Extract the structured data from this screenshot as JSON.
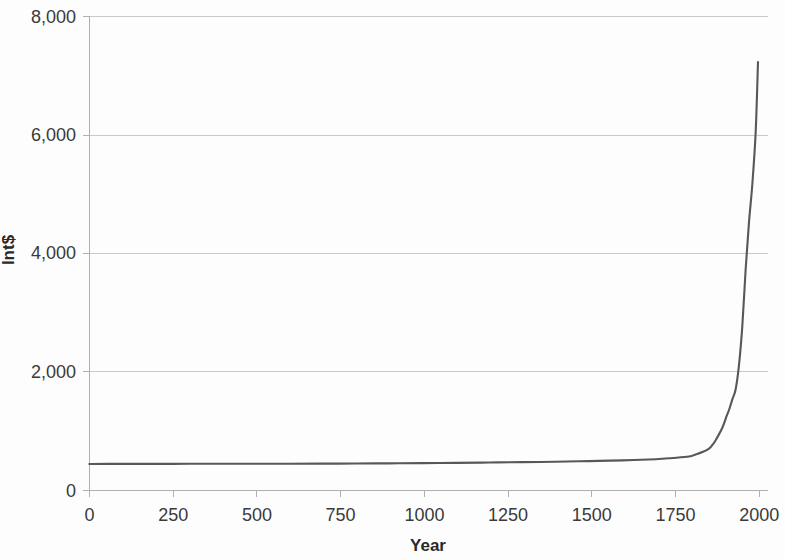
{
  "chart_data": {
    "type": "line",
    "title": "",
    "xlabel": "Year",
    "ylabel": "Int$",
    "xlim": [
      0,
      2010
    ],
    "ylim": [
      0,
      8000
    ],
    "grid": true,
    "legend": false,
    "x_ticks": [
      0,
      250,
      500,
      750,
      1000,
      1250,
      1500,
      1750,
      2000
    ],
    "x_tick_labels": [
      "0",
      "250",
      "500",
      "750",
      "1000",
      "1250",
      "1500",
      "1750",
      "2000"
    ],
    "y_ticks": [
      0,
      2000,
      4000,
      6000,
      8000
    ],
    "y_tick_labels": [
      "0",
      "2,000",
      "4,000",
      "6,000",
      "8,000"
    ],
    "series": [
      {
        "name": "GDP per capita",
        "color": "#58585a",
        "x": [
          1,
          100,
          200,
          300,
          400,
          500,
          600,
          700,
          800,
          900,
          1000,
          1100,
          1200,
          1300,
          1400,
          1500,
          1600,
          1700,
          1750,
          1800,
          1820,
          1840,
          1860,
          1870,
          1880,
          1900,
          1913,
          1920,
          1930,
          1940,
          1950,
          1960,
          1970,
          1980,
          1990,
          2000,
          2007
        ],
        "y": [
          440,
          441,
          441,
          442,
          442,
          443,
          444,
          445,
          447,
          450,
          453,
          458,
          464,
          470,
          477,
          488,
          500,
          520,
          540,
          565,
          600,
          640,
          700,
          760,
          840,
          1050,
          1250,
          1350,
          1530,
          1700,
          2110,
          2770,
          3730,
          4520,
          5160,
          6040,
          7223
        ]
      }
    ]
  },
  "axes": {
    "y_axis_title": "Int$",
    "x_axis_title": "Year"
  }
}
